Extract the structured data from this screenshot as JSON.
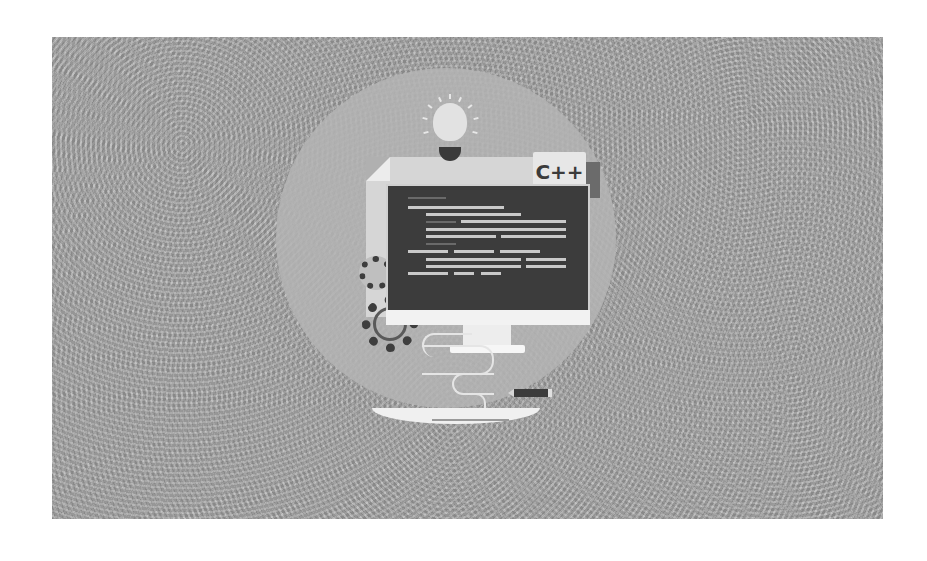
{
  "illustration": {
    "subject": "C++ programming concept art",
    "speech_bubble_text": "C++",
    "elements": [
      "lightbulb-icon",
      "document-icon",
      "monitor-icon",
      "code-lines",
      "gear-icon",
      "cable",
      "pencil-icon",
      "desk"
    ]
  },
  "colors": {
    "page_background": "#ffffff",
    "panel_background": "#a9a9a9",
    "circle_background": "#b4b4b4",
    "screen": "#3c3c3c",
    "code_text": "#c9c9c9",
    "bubble": "#e7e7e7",
    "gear": "#3e3e3e"
  }
}
